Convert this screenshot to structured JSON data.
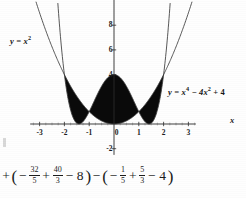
{
  "figure": {
    "background_color": "#fefefe",
    "ink_color": "#111111",
    "fill_color": "#0a0a0a"
  },
  "labels": {
    "parabola": {
      "lhs": "y = x",
      "exponent": "2",
      "full": "y = x²"
    },
    "quartic": {
      "part1": "y = x",
      "exp1": "4",
      "part2": " − 4x",
      "exp2": "2",
      "part3": " + 4",
      "full": "y = x⁴ − 4x² + 4"
    },
    "axis_x": "x"
  },
  "axes": {
    "x_ticks": [
      "-3",
      "-2",
      "-1",
      "0",
      "1",
      "2",
      "3"
    ],
    "x_tick_values": [
      -3,
      -2,
      -1,
      0,
      1,
      2,
      3
    ],
    "y_ticks": [
      "8",
      "6",
      "4",
      "-2"
    ],
    "y_tick_values": [
      8,
      6,
      4,
      -2
    ],
    "origin_label": "0",
    "xlim": [
      -3.4,
      3.4
    ],
    "ylim": [
      -3.0,
      9.6
    ]
  },
  "equation": {
    "tokens": [
      {
        "kind": "text",
        "value": "+"
      },
      {
        "kind": "paren",
        "value": "("
      },
      {
        "kind": "text",
        "value": "−"
      },
      {
        "kind": "frac",
        "num": "32",
        "den": "5"
      },
      {
        "kind": "text",
        "value": "+"
      },
      {
        "kind": "frac",
        "num": "40",
        "den": "3"
      },
      {
        "kind": "text",
        "value": "− 8"
      },
      {
        "kind": "paren",
        "value": ")"
      },
      {
        "kind": "text",
        "value": "−"
      },
      {
        "kind": "paren",
        "value": "("
      },
      {
        "kind": "text",
        "value": "−"
      },
      {
        "kind": "frac",
        "num": "1",
        "den": "5"
      },
      {
        "kind": "text",
        "value": "+"
      },
      {
        "kind": "frac",
        "num": "5",
        "den": "3"
      },
      {
        "kind": "text",
        "value": "− 4"
      },
      {
        "kind": "paren",
        "value": ")"
      }
    ],
    "plain": "+ (− 32/5 + 40/3 − 8) − (− 1/5 + 5/3 − 4)"
  },
  "chart_data": {
    "type": "line",
    "title": "",
    "xlabel": "x",
    "ylabel": "",
    "xlim": [
      -3.4,
      3.4
    ],
    "ylim": [
      -3.0,
      9.6
    ],
    "grid": false,
    "legend": "inline-curve-labels",
    "xticks": [
      -3,
      -2,
      -1,
      0,
      1,
      2,
      3
    ],
    "yticks": [
      -2,
      4,
      6,
      8
    ],
    "series": [
      {
        "name": "y = x²",
        "expression": "x^2",
        "label_position": "upper-left",
        "x": [
          -3.1,
          -2.8,
          -2.5,
          -2.2,
          -2.0,
          -1.75,
          -1.5,
          -1.25,
          -1.0,
          -0.75,
          -0.5,
          -0.25,
          0,
          0.25,
          0.5,
          0.75,
          1.0,
          1.25,
          1.5,
          1.75,
          2.0,
          2.2,
          2.5,
          2.8,
          3.1
        ],
        "y": [
          9.61,
          7.84,
          6.25,
          4.84,
          4.0,
          3.06,
          2.25,
          1.56,
          1.0,
          0.56,
          0.25,
          0.06,
          0,
          0.06,
          0.25,
          0.56,
          1.0,
          1.56,
          2.25,
          3.06,
          4.0,
          4.84,
          6.25,
          7.84,
          9.61
        ]
      },
      {
        "name": "y = x⁴ − 4x² + 4",
        "expression": "x^4 - 4x^2 + 4",
        "label_position": "right",
        "x": [
          -2.2,
          -2.0,
          -1.75,
          -1.5,
          -1.25,
          -1.0,
          -0.75,
          -0.5,
          -0.25,
          0,
          0.25,
          0.5,
          0.75,
          1.0,
          1.25,
          1.5,
          1.75,
          2.0,
          2.2
        ],
        "y": [
          4.06,
          4.0,
          2.13,
          1.06,
          0.69,
          1.0,
          1.78,
          2.81,
          3.75,
          4.0,
          3.75,
          2.81,
          1.78,
          1.0,
          0.69,
          1.06,
          2.13,
          4.0,
          4.06
        ]
      }
    ],
    "shaded_regions": [
      {
        "name": "left-lobe",
        "x_from": -2,
        "x_to": -1,
        "between": [
          "y = x²",
          "y = x⁴ − 4x² + 4"
        ]
      },
      {
        "name": "center-lobe",
        "x_from": -1,
        "x_to": 1,
        "between": [
          "y = x⁴ − 4x² + 4",
          "y = x²"
        ]
      },
      {
        "name": "right-lobe",
        "x_from": 1,
        "x_to": 2,
        "between": [
          "y = x²",
          "y = x⁴ − 4x² + 4"
        ]
      }
    ],
    "intersections": [
      {
        "x": -2,
        "y": 4
      },
      {
        "x": -1,
        "y": 1
      },
      {
        "x": 1,
        "y": 1
      },
      {
        "x": 2,
        "y": 4
      }
    ]
  }
}
